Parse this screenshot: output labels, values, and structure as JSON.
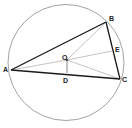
{
  "diagram": {
    "type": "geometry",
    "colors": {
      "background": "#ffffff",
      "circle": "#8a8a8a",
      "triangle": "#1a1a1a",
      "construction": "#9a9a9a",
      "label": "#222222"
    },
    "circle": {
      "center": "O",
      "cx": 66,
      "cy": 62.5,
      "r": 58
    },
    "points": {
      "A": {
        "x": 11,
        "y": 70
      },
      "B": {
        "x": 106,
        "y": 22
      },
      "C": {
        "x": 120,
        "y": 79
      },
      "O": {
        "x": 67,
        "y": 60
      },
      "D": {
        "x": 67,
        "y": 73
      },
      "E": {
        "x": 112,
        "y": 51
      }
    },
    "labels": {
      "A": "A",
      "B": "B",
      "C": "C",
      "O": "O",
      "D": "D",
      "E": "E"
    },
    "segments": {
      "triangle": [
        [
          "A",
          "B"
        ],
        [
          "B",
          "C"
        ],
        [
          "C",
          "A"
        ]
      ],
      "construction": [
        [
          "O",
          "A"
        ],
        [
          "O",
          "B"
        ],
        [
          "O",
          "C"
        ],
        [
          "O",
          "D"
        ],
        [
          "O",
          "E"
        ]
      ]
    }
  }
}
